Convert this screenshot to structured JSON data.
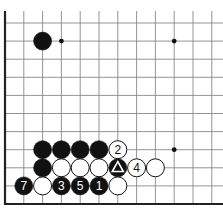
{
  "board": {
    "title": "Go diagram (corner fragment)",
    "columns_visible": 12,
    "rows_visible": 11,
    "edges": [
      "left",
      "bottom"
    ],
    "colors": {
      "black": "#111111",
      "white": "#ffffff",
      "line": "#888888",
      "edge": "#222222"
    }
  },
  "star_points": [
    {
      "col": 9,
      "row": 9
    },
    {
      "col": 9,
      "row": 3
    }
  ],
  "marks": [
    {
      "col": 3,
      "row": 9,
      "type": "small-dot"
    }
  ],
  "stones": [
    {
      "col": 2,
      "row": 9,
      "color": "black",
      "label": ""
    },
    {
      "col": 2,
      "row": 3,
      "color": "black",
      "label": ""
    },
    {
      "col": 3,
      "row": 3,
      "color": "black",
      "label": ""
    },
    {
      "col": 4,
      "row": 3,
      "color": "black",
      "label": ""
    },
    {
      "col": 5,
      "row": 3,
      "color": "black",
      "label": ""
    },
    {
      "col": 6,
      "row": 3,
      "color": "white",
      "label": "2"
    },
    {
      "col": 2,
      "row": 2,
      "color": "black",
      "label": ""
    },
    {
      "col": 3,
      "row": 2,
      "color": "white",
      "label": ""
    },
    {
      "col": 4,
      "row": 2,
      "color": "white",
      "label": ""
    },
    {
      "col": 5,
      "row": 2,
      "color": "white",
      "label": ""
    },
    {
      "col": 6,
      "row": 2,
      "color": "black",
      "label": "",
      "marker": "triangle"
    },
    {
      "col": 7,
      "row": 2,
      "color": "white",
      "label": "4"
    },
    {
      "col": 8,
      "row": 2,
      "color": "white",
      "label": ""
    },
    {
      "col": 1,
      "row": 1,
      "color": "black",
      "label": "7"
    },
    {
      "col": 2,
      "row": 1,
      "color": "white",
      "label": ""
    },
    {
      "col": 3,
      "row": 1,
      "color": "black",
      "label": "3"
    },
    {
      "col": 4,
      "row": 1,
      "color": "black",
      "label": "5"
    },
    {
      "col": 5,
      "row": 1,
      "color": "black",
      "label": "1"
    },
    {
      "col": 6,
      "row": 1,
      "color": "white",
      "label": ""
    }
  ]
}
